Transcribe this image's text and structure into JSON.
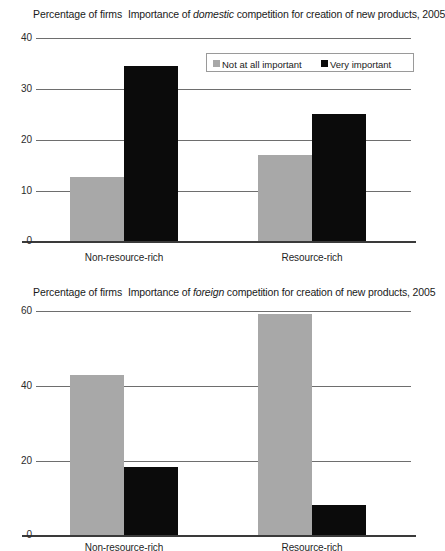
{
  "charts": [
    {
      "id": "domestic",
      "axis_caption": "Percentage of firms",
      "title_prefix": "Importance of ",
      "title_em": "domestic",
      "title_suffix": " competition for creation of new products, 2005",
      "yticks": [
        "40",
        "30",
        "20",
        "10",
        "0"
      ],
      "categories": [
        "Non-resource-rich",
        "Resource-rich"
      ],
      "legend": [
        {
          "label": "Not at all important",
          "color": "#a8a8a8"
        },
        {
          "label": "Very important",
          "color": "#0b0b0b"
        }
      ],
      "chart_data": {
        "type": "bar",
        "title": "Importance of domestic competition for creation of new products, 2005",
        "xlabel": "",
        "ylabel": "Percentage of firms",
        "ylim": [
          0,
          40
        ],
        "yticks": [
          0,
          10,
          20,
          30,
          40
        ],
        "grid": true,
        "legend_position": "top-right",
        "categories": [
          "Non-resource-rich",
          "Resource-rich"
        ],
        "series": [
          {
            "name": "Not at all important",
            "color": "#a8a8a8",
            "values": [
              12.6,
              16.9
            ]
          },
          {
            "name": "Very important",
            "color": "#0b0b0b",
            "values": [
              34.5,
              25.0
            ]
          }
        ]
      }
    },
    {
      "id": "foreign",
      "axis_caption": "Percentage of firms",
      "title_prefix": "Importance of ",
      "title_em": "foreign",
      "title_suffix": " competition for creation of new products, 2005",
      "yticks": [
        "60",
        "40",
        "20",
        "0"
      ],
      "categories": [
        "Non-resource-rich",
        "Resource-rich"
      ],
      "legend": [],
      "chart_data": {
        "type": "bar",
        "title": "Importance of foreign competition for creation of new products, 2005",
        "xlabel": "",
        "ylabel": "Percentage of firms",
        "ylim": [
          0,
          60
        ],
        "yticks": [
          0,
          20,
          40,
          60
        ],
        "grid": true,
        "legend_position": "none",
        "categories": [
          "Non-resource-rich",
          "Resource-rich"
        ],
        "series": [
          {
            "name": "Not at all important",
            "color": "#a8a8a8",
            "values": [
              42.8,
              59.2
            ]
          },
          {
            "name": "Very important",
            "color": "#0b0b0b",
            "values": [
              18.3,
              8.0
            ]
          }
        ]
      }
    }
  ]
}
